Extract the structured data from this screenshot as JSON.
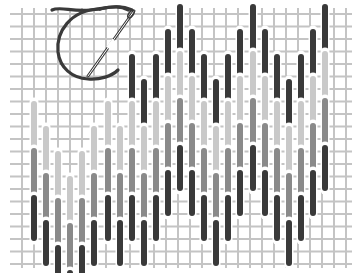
{
  "figure": {
    "title": "",
    "colors": {
      "background": "#ffffff",
      "canvas_thread": "#c4c4c4",
      "stitch_dark": "#3a3a3a",
      "stitch_medium": "#8a8a8a",
      "stitch_light": "#c9c9c9",
      "thread": "#3a3a3a",
      "needle": "#3a3a3a"
    }
  },
  "canvas": {
    "x_start": 10,
    "x_end": 352,
    "y_start": 8,
    "y_end": 268,
    "col_spacing": 12,
    "row_spacing": 12.5
  },
  "stitch_pattern": {
    "stitch_length": 44,
    "stitch_width": 6,
    "band_gap": 3,
    "column_x": [
      34,
      46,
      58,
      70,
      82,
      94,
      108,
      120,
      132,
      144,
      156,
      168,
      180,
      192,
      204,
      216,
      228,
      240,
      253,
      265,
      277,
      289,
      301,
      313,
      325
    ],
    "column_top": [
      55,
      80,
      105,
      130,
      105,
      80,
      55,
      80,
      55,
      80,
      55,
      30,
      5,
      30,
      55,
      80,
      55,
      30,
      5,
      30,
      55,
      80,
      55,
      30,
      5
    ],
    "bands": [
      {
        "name": "dark-top",
        "tone": "dark"
      },
      {
        "name": "light",
        "tone": "light"
      },
      {
        "name": "medium",
        "tone": "medium"
      },
      {
        "name": "dark-bottom",
        "tone": "dark"
      }
    ],
    "first_band_by_column": [
      1,
      1,
      1,
      1,
      1,
      1,
      1,
      1,
      0,
      0,
      0,
      0,
      0,
      0,
      0,
      0,
      0,
      0,
      0,
      0,
      0,
      0,
      0,
      0,
      0
    ]
  },
  "needle": {
    "label": "needle-with-thread"
  }
}
